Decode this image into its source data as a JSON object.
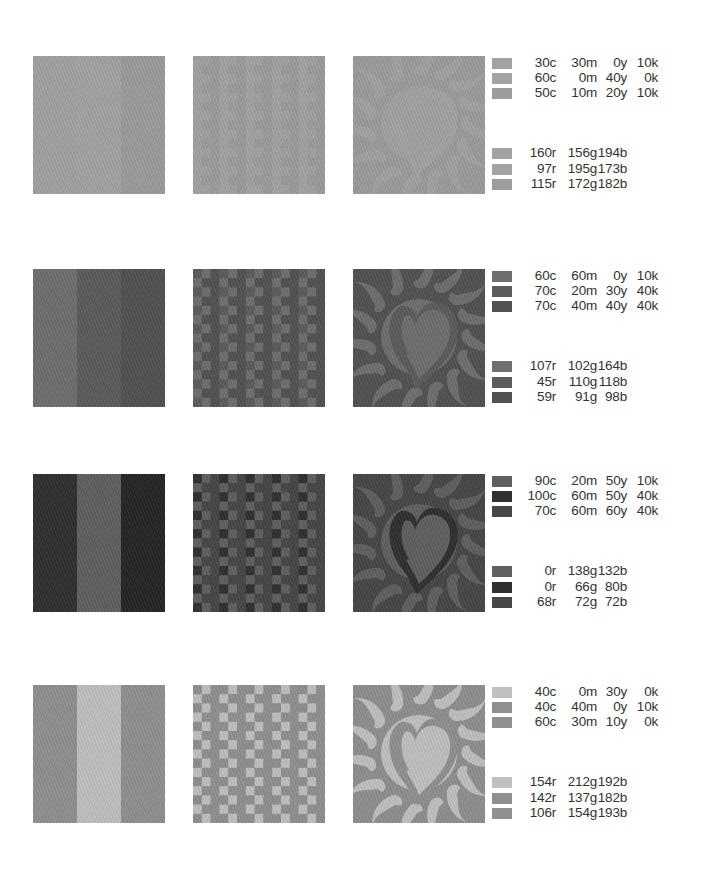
{
  "rows": [
    {
      "top": 56,
      "palette": [
        "#a2a2a2",
        "#a3a3a3",
        "#9c9c9c"
      ],
      "cmyk": [
        {
          "c": "30c",
          "m": "30m",
          "y": "0y",
          "k": "10k"
        },
        {
          "c": "60c",
          "m": "0m",
          "y": "40y",
          "k": "0k"
        },
        {
          "c": "50c",
          "m": "10m",
          "y": "20y",
          "k": "10k"
        }
      ],
      "rgb": [
        {
          "r": "160r",
          "g": "156g",
          "b": "194b"
        },
        {
          "r": "97r",
          "g": "195g",
          "b": "173b"
        },
        {
          "r": "115r",
          "g": "172g",
          "b": "182b"
        }
      ]
    },
    {
      "top": 269,
      "palette": [
        "#6f6f6f",
        "#5c5c5c",
        "#525252"
      ],
      "cmyk": [
        {
          "c": "60c",
          "m": "60m",
          "y": "0y",
          "k": "10k"
        },
        {
          "c": "70c",
          "m": "20m",
          "y": "30y",
          "k": "40k"
        },
        {
          "c": "70c",
          "m": "40m",
          "y": "40y",
          "k": "40k"
        }
      ],
      "rgb": [
        {
          "r": "107r",
          "g": "102g",
          "b": "164b"
        },
        {
          "r": "45r",
          "g": "110g",
          "b": "118b"
        },
        {
          "r": "59r",
          "g": "91g",
          "b": "98b"
        }
      ]
    },
    {
      "top": 474,
      "palette": [
        "#606060",
        "#303030",
        "#474747"
      ],
      "cmyk": [
        {
          "c": "90c",
          "m": "20m",
          "y": "50y",
          "k": "10k"
        },
        {
          "c": "100c",
          "m": "60m",
          "y": "50y",
          "k": "40k"
        },
        {
          "c": "70c",
          "m": "60m",
          "y": "60y",
          "k": "40k"
        }
      ],
      "rgb": [
        {
          "r": "0r",
          "g": "138g",
          "b": "132b"
        },
        {
          "r": "0r",
          "g": "66g",
          "b": "80b"
        },
        {
          "r": "68r",
          "g": "72g",
          "b": "72b"
        }
      ]
    },
    {
      "top": 685,
      "palette": [
        "#c0c0c0",
        "#8f8f8f",
        "#909090"
      ],
      "cmyk": [
        {
          "c": "40c",
          "m": "0m",
          "y": "30y",
          "k": "0k"
        },
        {
          "c": "40c",
          "m": "40m",
          "y": "0y",
          "k": "10k"
        },
        {
          "c": "60c",
          "m": "30m",
          "y": "10y",
          "k": "0k"
        }
      ],
      "rgb": [
        {
          "r": "154r",
          "g": "212g",
          "b": "192b"
        },
        {
          "r": "142r",
          "g": "137g",
          "b": "182b"
        },
        {
          "r": "106r",
          "g": "154g",
          "b": "193b"
        }
      ]
    }
  ],
  "icons": {
    "pattern_1": "vertical-stripes",
    "pattern_2": "checkerboard-weave",
    "pattern_3": "flaming-heart"
  }
}
